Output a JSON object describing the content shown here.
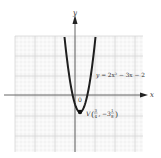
{
  "figure": {
    "type": "parabola-graph",
    "axes": {
      "x_label": "x",
      "y_label": "y",
      "origin_label": "0"
    },
    "equation": {
      "lhs": "y",
      "eq": "=",
      "rhs": "2x² − 3x − 2"
    },
    "vertex": {
      "name": "V",
      "x_num": "3",
      "x_den": "4",
      "y_sign": "−",
      "y_whole": "3",
      "y_num": "1",
      "y_den": "8"
    },
    "colors": {
      "grid_minor": "#e6e6e6",
      "grid_major": "#cfcfcf",
      "grid_bg": "#f2f2f2",
      "axis": "#555555",
      "curve": "#222222"
    }
  }
}
